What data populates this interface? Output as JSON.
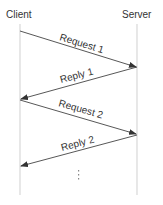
{
  "diagram": {
    "type": "sequence",
    "participants": [
      {
        "name": "Client",
        "x": 20
      },
      {
        "name": "Server",
        "x": 137
      }
    ],
    "messages": [
      {
        "label": "Request 1",
        "from": "Client",
        "to": "Server"
      },
      {
        "label": "Reply 1",
        "from": "Server",
        "to": "Client"
      },
      {
        "label": "Request 2",
        "from": "Client",
        "to": "Server"
      },
      {
        "label": "Reply 2",
        "from": "Server",
        "to": "Client"
      }
    ],
    "continuation": "⋮",
    "colors": {
      "lifeline": "#d8d8d8",
      "arrow": "#444444",
      "text": "#333333"
    }
  }
}
